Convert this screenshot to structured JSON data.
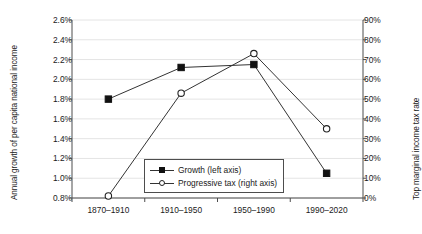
{
  "chart_data": {
    "type": "line",
    "title": "",
    "categories": [
      "1870–1910",
      "1910–1950",
      "1950–1990",
      "1990–2020"
    ],
    "series": [
      {
        "name": "Growth (left axis)",
        "axis": "left",
        "marker": "filled-square",
        "values": [
          1.8,
          2.12,
          2.15,
          1.05
        ]
      },
      {
        "name": "Progressive tax (right axis)",
        "axis": "right",
        "marker": "open-circle",
        "values": [
          1,
          53,
          73,
          35
        ]
      }
    ],
    "xlabel": "",
    "ylabel": "Annual growth of per capita national income",
    "y2label": "Top marginal income tax rate",
    "ylim": [
      0.8,
      2.6
    ],
    "y2lim": [
      0,
      90
    ],
    "yticks": [
      "0.8%",
      "1.0%",
      "1.2%",
      "1.4%",
      "1.6%",
      "1.8%",
      "2.0%",
      "2.2%",
      "2.4%",
      "2.6%"
    ],
    "y2ticks": [
      "0%",
      "10%",
      "20%",
      "30%",
      "40%",
      "50%",
      "60%",
      "70%",
      "80%",
      "90%"
    ],
    "ytick_values": [
      0.8,
      1.0,
      1.2,
      1.4,
      1.6,
      1.8,
      2.0,
      2.2,
      2.4,
      2.6
    ],
    "y2tick_values": [
      0,
      10,
      20,
      30,
      40,
      50,
      60,
      70,
      80,
      90
    ],
    "grid": true,
    "grid_axis": "y",
    "legend": {
      "position": "inside-bottom-center",
      "entries": [
        {
          "label": "Growth (left axis)",
          "marker": "filled-square"
        },
        {
          "label": "Progressive tax (right axis)",
          "marker": "open-circle"
        }
      ]
    },
    "colors": {
      "series_line": "#333333",
      "grid": "#e4e4e4",
      "axis": "#4d4d4d",
      "text": "#1a1a1a",
      "background": "#ffffff"
    }
  }
}
